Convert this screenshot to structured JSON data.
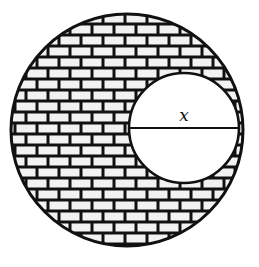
{
  "figure": {
    "outer_circle": {
      "cx": 127,
      "cy": 130,
      "r": 116,
      "fill": "brick-pattern"
    },
    "inner_circle": {
      "cx": 184,
      "cy": 128,
      "r": 55,
      "fill": "#ffffff"
    },
    "diameter_label": "x",
    "colors": {
      "stroke": "#111111",
      "brick": "#f2f2f2",
      "mortar": "#111111",
      "background": "#ffffff"
    }
  }
}
